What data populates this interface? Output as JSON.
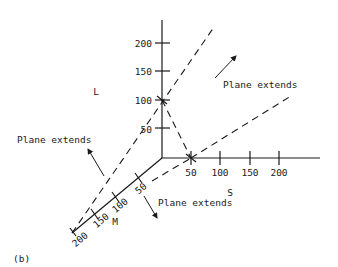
{
  "figure": {
    "panel_label": "(b)",
    "axes": {
      "L": {
        "label": "L",
        "ticks": [
          "50",
          "100",
          "150",
          "200"
        ]
      },
      "S": {
        "label": "S",
        "ticks": [
          "50",
          "100",
          "150",
          "200"
        ]
      },
      "M": {
        "label": "M",
        "ticks": [
          "50",
          "100",
          "150",
          "200"
        ]
      }
    },
    "annotations": {
      "upper_right": "Plane extends",
      "left": "Plane extends",
      "lower": "Plane extends"
    },
    "plane_intercepts": {
      "L": 100,
      "S": 50,
      "M": 200
    }
  }
}
